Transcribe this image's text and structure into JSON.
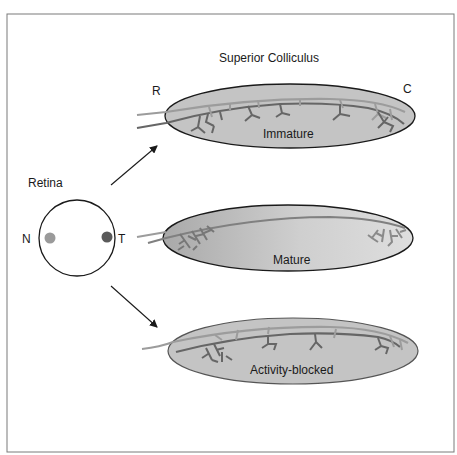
{
  "title": "Superior Colliculus",
  "retina": {
    "label": "Retina",
    "nasal_label": "N",
    "temporal_label": "T",
    "nasal_dot_color": "#9a9a9a",
    "temporal_dot_color": "#5a5a5a"
  },
  "axis_labels": {
    "rostral": "R",
    "caudal": "C"
  },
  "panels": [
    {
      "id": "immature",
      "label": "Immature"
    },
    {
      "id": "mature",
      "label": "Mature"
    },
    {
      "id": "activity-blocked",
      "label": "Activity-blocked"
    }
  ],
  "colors": {
    "frame": "#7a7a7a",
    "ellipse_fill": "#c4c4c4",
    "ellipse_stroke": "#1a1a1a",
    "nasal_axon": "#9c9c9c",
    "temporal_axon": "#666666",
    "arrow": "#1a1a1a"
  }
}
